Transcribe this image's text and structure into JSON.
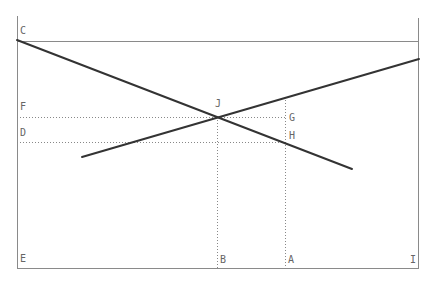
{
  "diagram": {
    "type": "supply-demand-geometry",
    "colors": {
      "background": "#ffffff",
      "frame": "#8a8a8a",
      "curve": "#333333",
      "guide": "#888888",
      "label": "#666666"
    },
    "frame": {
      "left_x": 17,
      "right_x": 419,
      "top_line_y": 41,
      "bottom_y": 269,
      "left_top_y": 16,
      "right_top_y": 18
    },
    "curves": [
      {
        "name": "falling-line",
        "x1": 17,
        "y1": 40,
        "x2": 352,
        "y2": 169
      },
      {
        "name": "rising-line",
        "x1": 82,
        "y1": 157,
        "x2": 419,
        "y2": 59
      }
    ],
    "guides": [
      {
        "name": "guide-F-J",
        "x1": 17,
        "y1": 117,
        "x2": 285,
        "y2": 117
      },
      {
        "name": "guide-D-H",
        "x1": 17,
        "y1": 142,
        "x2": 285,
        "y2": 142
      },
      {
        "name": "guide-J-B",
        "x1": 217,
        "y1": 117,
        "x2": 217,
        "y2": 269
      },
      {
        "name": "guide-A",
        "x1": 285,
        "y1": 100,
        "x2": 285,
        "y2": 269
      }
    ],
    "labels": [
      {
        "id": "C",
        "text": "C",
        "x": 20,
        "y": 34
      },
      {
        "id": "F",
        "text": "F",
        "x": 20,
        "y": 110
      },
      {
        "id": "D",
        "text": "D",
        "x": 20,
        "y": 136
      },
      {
        "id": "E",
        "text": "E",
        "x": 20,
        "y": 262
      },
      {
        "id": "J",
        "text": "J",
        "x": 215,
        "y": 107
      },
      {
        "id": "G",
        "text": "G",
        "x": 289,
        "y": 121
      },
      {
        "id": "H",
        "text": "H",
        "x": 289,
        "y": 139
      },
      {
        "id": "B",
        "text": "B",
        "x": 220,
        "y": 263
      },
      {
        "id": "A",
        "text": "A",
        "x": 288,
        "y": 263
      },
      {
        "id": "I",
        "text": "I",
        "x": 410,
        "y": 263
      }
    ]
  }
}
